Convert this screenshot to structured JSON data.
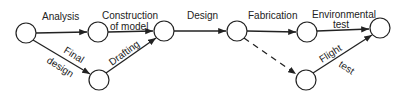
{
  "diagram": {
    "type": "activity-network",
    "colors": {
      "line": "#222222",
      "node_fill": "#ffffff",
      "background": "#ffffff"
    },
    "nodes": [
      {
        "id": "n1",
        "x": 26,
        "y": 33
      },
      {
        "id": "n2",
        "x": 98,
        "y": 32
      },
      {
        "id": "n3",
        "x": 164,
        "y": 31
      },
      {
        "id": "n4",
        "x": 237,
        "y": 31
      },
      {
        "id": "n5",
        "x": 307,
        "y": 32
      },
      {
        "id": "n6",
        "x": 380,
        "y": 28
      },
      {
        "id": "n7",
        "x": 99,
        "y": 80
      },
      {
        "id": "n8",
        "x": 306,
        "y": 80
      }
    ],
    "edges": [
      {
        "from": "n1",
        "to": "n2",
        "label": "Analysis",
        "style": "solid"
      },
      {
        "from": "n2",
        "to": "n3",
        "label": "Construction of model",
        "style": "solid"
      },
      {
        "from": "n1",
        "to": "n7",
        "label": "Final design",
        "style": "solid"
      },
      {
        "from": "n7",
        "to": "n3",
        "label": "Drafting",
        "style": "solid"
      },
      {
        "from": "n3",
        "to": "n4",
        "label": "Design",
        "style": "solid"
      },
      {
        "from": "n4",
        "to": "n5",
        "label": "Fabrication",
        "style": "solid"
      },
      {
        "from": "n5",
        "to": "n6",
        "label": "Environmental test",
        "style": "solid"
      },
      {
        "from": "n4",
        "to": "n8",
        "label": "",
        "style": "dashed"
      },
      {
        "from": "n8",
        "to": "n6",
        "label": "Flight test",
        "style": "solid"
      }
    ],
    "labels": {
      "analysis": "Analysis",
      "construction_l1": "Construction",
      "construction_l2": "of model",
      "final": "Final",
      "design_low": "design",
      "drafting": "Drafting",
      "design": "Design",
      "fabrication": "Fabrication",
      "environmental_l1": "Environmental",
      "environmental_l2": "test",
      "flight": "Flight",
      "flight_test": "test"
    }
  }
}
